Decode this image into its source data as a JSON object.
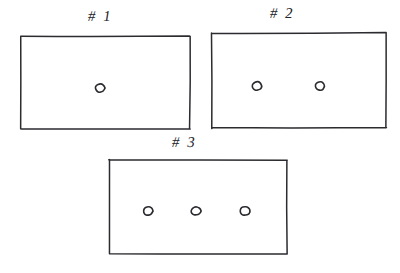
{
  "figure": {
    "kind": "hand-drawn-sketch",
    "background_color": "#ffffff",
    "ink_color": "#2b2b30",
    "canvas": {
      "width": 400,
      "height": 273
    }
  },
  "panels": [
    {
      "id": "panel-1",
      "label": "# 1",
      "label_position": {
        "x": 88,
        "y": 8
      },
      "rect": {
        "x": 21,
        "y": 36,
        "width": 169,
        "height": 93
      },
      "circle_count": 1,
      "circles": [
        {
          "cx": 100,
          "cy": 88,
          "rx": 4.8,
          "ry": 4.4
        }
      ]
    },
    {
      "id": "panel-2",
      "label": "# 2",
      "label_position": {
        "x": 270,
        "y": 5
      },
      "rect": {
        "x": 212,
        "y": 33,
        "width": 174,
        "height": 95
      },
      "circle_count": 2,
      "circles": [
        {
          "cx": 257,
          "cy": 86,
          "rx": 4.8,
          "ry": 4.4
        },
        {
          "cx": 320,
          "cy": 86,
          "rx": 4.8,
          "ry": 4.4
        }
      ]
    },
    {
      "id": "panel-3",
      "label": "# 3",
      "label_position": {
        "x": 172,
        "y": 134
      },
      "rect": {
        "x": 109,
        "y": 160,
        "width": 178,
        "height": 94
      },
      "circle_count": 3,
      "circles": [
        {
          "cx": 148,
          "cy": 211,
          "rx": 4.8,
          "ry": 4.4
        },
        {
          "cx": 196,
          "cy": 211,
          "rx": 5.0,
          "ry": 4.2
        },
        {
          "cx": 245,
          "cy": 211,
          "rx": 5.2,
          "ry": 4.6
        }
      ]
    }
  ]
}
